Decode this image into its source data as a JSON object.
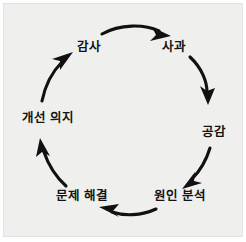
{
  "diagram": {
    "type": "cycle",
    "direction": "clockwise",
    "background_color": "#efefee",
    "text_color": "#141414",
    "arrow_color": "#111111",
    "nodes": [
      {
        "id": "gratitude",
        "label": "감사",
        "position": "top-left",
        "x": 85,
        "y": 43,
        "angle_deg": 240
      },
      {
        "id": "apology",
        "label": "사과",
        "position": "top-right",
        "x": 170,
        "y": 43,
        "angle_deg": 300
      },
      {
        "id": "empathy",
        "label": "공감",
        "position": "right",
        "x": 210,
        "y": 128,
        "angle_deg": 0
      },
      {
        "id": "root-cause",
        "label": "원인 분석",
        "position": "bottom-right",
        "x": 176,
        "y": 192,
        "angle_deg": 60
      },
      {
        "id": "resolution",
        "label": "문제 해결",
        "position": "bottom-left",
        "x": 78,
        "y": 192,
        "angle_deg": 120
      },
      {
        "id": "improvement",
        "label": "개선 의지",
        "position": "left",
        "x": 44,
        "y": 114,
        "angle_deg": 180
      }
    ],
    "arrows": [
      {
        "id": "arrow-gratitude-to-apology",
        "from": "gratitude",
        "to": "apology",
        "label": ""
      },
      {
        "id": "arrow-apology-to-empathy",
        "from": "apology",
        "to": "empathy",
        "label": ""
      },
      {
        "id": "arrow-empathy-to-rootcause",
        "from": "empathy",
        "to": "root-cause",
        "label": ""
      },
      {
        "id": "arrow-rootcause-to-resolution",
        "from": "root-cause",
        "to": "resolution",
        "label": ""
      },
      {
        "id": "arrow-resolution-to-improve",
        "from": "resolution",
        "to": "improvement",
        "label": ""
      },
      {
        "id": "arrow-improve-to-gratitude",
        "from": "improvement",
        "to": "gratitude",
        "label": ""
      }
    ]
  }
}
